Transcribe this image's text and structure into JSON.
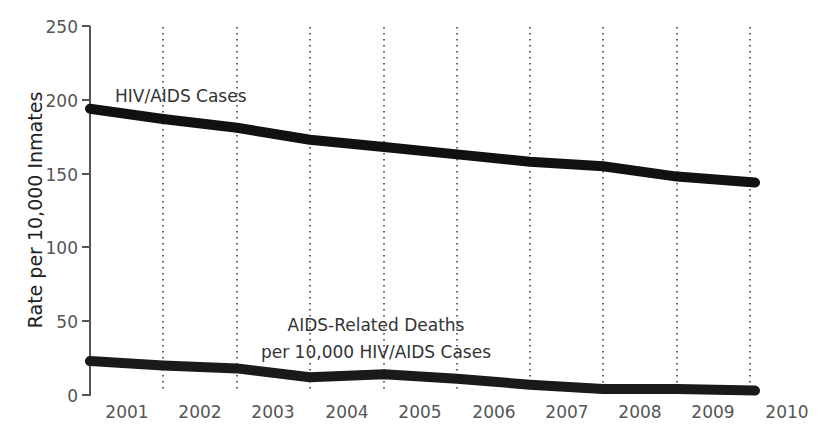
{
  "chart_data": {
    "type": "line",
    "title": "",
    "xlabel": "",
    "ylabel": "Rate per 10,000 Inmates",
    "ylim": [
      0,
      250
    ],
    "yticks": [
      0,
      50,
      100,
      150,
      200,
      250
    ],
    "categories": [
      "2001",
      "2002",
      "2003",
      "2004",
      "2005",
      "2006",
      "2007",
      "2008",
      "2009",
      "2010"
    ],
    "x": [
      2001,
      2002,
      2003,
      2004,
      2005,
      2006,
      2007,
      2008,
      2009,
      2010
    ],
    "grid": "vertical dotted lines between year labels",
    "legend": "none (inline annotations)",
    "series": [
      {
        "name": "HIV/AIDS Cases",
        "values": [
          194,
          187,
          181,
          173,
          168,
          163,
          158,
          155,
          148,
          144
        ]
      },
      {
        "name": "AIDS-Related Deaths per 10,000 HIV/AIDS Cases",
        "values": [
          23,
          20,
          18,
          12,
          14,
          11,
          7,
          4,
          4,
          3
        ]
      }
    ],
    "annotations": [
      "HIV/AIDS Cases",
      "AIDS-Related Deaths",
      "per 10,000 HIV/AIDS Cases"
    ]
  },
  "labels": {
    "ylabel": "Rate per 10,000 Inmates",
    "series1_label": "HIV/AIDS Cases",
    "series2_label_line1": "AIDS-Related Deaths",
    "series2_label_line2": "per 10,000 HIV/AIDS Cases",
    "yticks": [
      "0",
      "50",
      "100",
      "150",
      "200",
      "250"
    ],
    "xticks": [
      "2001",
      "2002",
      "2003",
      "2004",
      "2005",
      "2006",
      "2007",
      "2008",
      "2009",
      "2010"
    ]
  },
  "colors": {
    "line": "#111111",
    "axis": "#555555",
    "grid": "#666666",
    "text": "#444444"
  }
}
